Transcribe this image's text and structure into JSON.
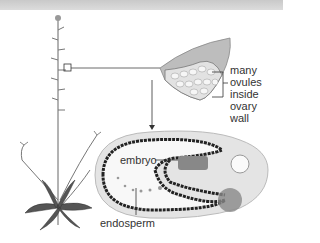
{
  "diagram": {
    "labels": {
      "ovules": [
        "many ovules",
        "inside ovary",
        "wall"
      ],
      "embryo": "embryo",
      "endosperm": "endosperm"
    },
    "parts": {
      "plant": "whole-plant",
      "ovary": "ovary-cross-section",
      "seed": "seed-section"
    }
  }
}
